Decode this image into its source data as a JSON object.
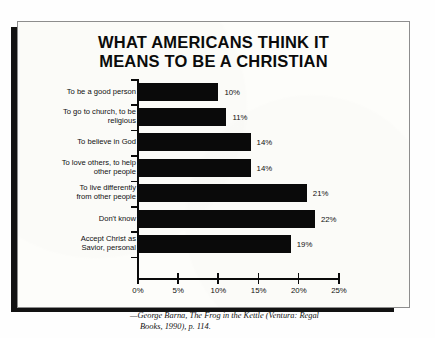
{
  "title": {
    "line1": "WHAT AMERICANS THINK IT",
    "line2": "MEANS TO BE A CHRISTIAN"
  },
  "caption": {
    "line1": "—George Barna, The Frog in the Kettle (Ventura: Regal",
    "line2": "Books, 1990), p. 114."
  },
  "colors": {
    "bar": "#0a0a0a",
    "axis": "#0a0a0a",
    "paper": "#fdfdfa",
    "shadow": "#121212"
  },
  "chart_data": {
    "type": "bar",
    "orientation": "horizontal",
    "title": "WHAT AMERICANS THINK IT MEANS TO BE A CHRISTIAN",
    "xlabel": "",
    "ylabel": "",
    "xlim": [
      0,
      25
    ],
    "grid": false,
    "legend": false,
    "xticks": [
      "0%",
      "5%",
      "10%",
      "15%",
      "20%",
      "25%"
    ],
    "xtick_values": [
      0,
      5,
      10,
      15,
      20,
      25
    ],
    "categories": [
      "To be a good person",
      "To go to church, to be religious",
      "To believe in God",
      "To love others, to help other people",
      "To live differently from other people",
      "Don't know",
      "Accept Christ as Savior, personal"
    ],
    "values": [
      10,
      11,
      14,
      14,
      21,
      22,
      19
    ],
    "data_labels": [
      "10%",
      "11%",
      "14%",
      "14%",
      "21%",
      "22%",
      "19%"
    ],
    "rows": [
      {
        "label_lines": [
          "To be a good person"
        ],
        "value": 10,
        "data_label": "10%"
      },
      {
        "label_lines": [
          "To go to church, to be",
          "religious"
        ],
        "value": 11,
        "data_label": "11%"
      },
      {
        "label_lines": [
          "To believe in God"
        ],
        "value": 14,
        "data_label": "14%"
      },
      {
        "label_lines": [
          "To love others, to help",
          "other people"
        ],
        "value": 14,
        "data_label": "14%"
      },
      {
        "label_lines": [
          "To live differently",
          "from other people"
        ],
        "value": 21,
        "data_label": "21%"
      },
      {
        "label_lines": [
          "Don't know"
        ],
        "value": 22,
        "data_label": "22%"
      },
      {
        "label_lines": [
          "Accept Christ as",
          "Savior, personal"
        ],
        "value": 19,
        "data_label": "19%"
      }
    ]
  }
}
